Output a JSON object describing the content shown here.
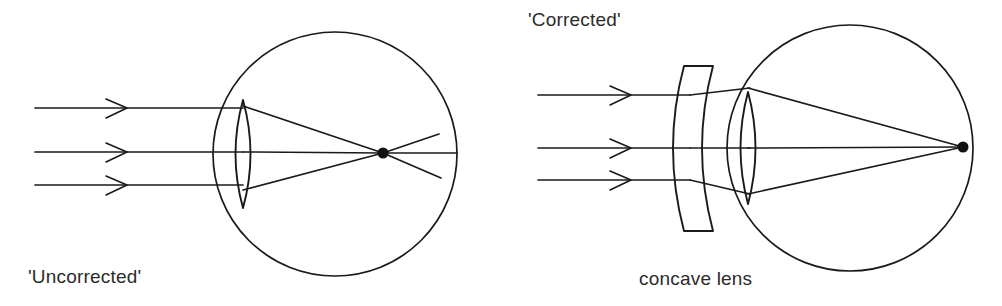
{
  "figure": {
    "title_text": null,
    "background_color": "#ffffff",
    "ink_color": "#1a1a1a",
    "text_color": "#2b2b2b",
    "width": 1002,
    "height": 306
  },
  "panels": [
    {
      "id": "uncorrected",
      "label": "'Uncorrected'",
      "label_position": {
        "x": 28,
        "y": 283
      },
      "eyeball": {
        "cx": 335,
        "cy": 154,
        "r": 122
      },
      "crystalline_lens": {
        "cx": 243,
        "cy": 154,
        "half_height": 54,
        "half_width": 13
      },
      "focal_point": {
        "x": 383,
        "y": 153,
        "r": 5
      },
      "focal_point_note": "focus falls in front of the retina",
      "incoming_rays": [
        {
          "y": 108,
          "x_start": 35,
          "x_end": 243
        },
        {
          "y": 152,
          "x_start": 35,
          "x_end": 243
        },
        {
          "y": 185,
          "x_start": 35,
          "x_end": 243
        }
      ],
      "arrowheads": [
        {
          "x": 124,
          "y": 108
        },
        {
          "x": 124,
          "y": 152
        },
        {
          "x": 124,
          "y": 185
        }
      ],
      "refracted_rays": [
        {
          "x1": 243,
          "y1": 106,
          "x2": 383,
          "y2": 153
        },
        {
          "x1": 243,
          "y1": 152,
          "x2": 383,
          "y2": 153
        },
        {
          "x1": 243,
          "y1": 190,
          "x2": 383,
          "y2": 153
        }
      ],
      "diverging_rays": [
        {
          "x1": 383,
          "y1": 153,
          "x2": 438,
          "y2": 135
        },
        {
          "x1": 383,
          "y1": 153,
          "x2": 457,
          "y2": 153
        },
        {
          "x1": 383,
          "y1": 153,
          "x2": 440,
          "y2": 177
        }
      ]
    },
    {
      "id": "corrected",
      "label": "'Corrected'",
      "label_position": {
        "x": 528,
        "y": 26
      },
      "part_label": "concave lens",
      "part_label_position": {
        "x": 639,
        "y": 285
      },
      "eyeball": {
        "cx": 850,
        "cy": 148,
        "r": 123
      },
      "crystalline_lens": {
        "cx": 748,
        "cy": 148,
        "half_height": 56,
        "half_width": 13
      },
      "concave_lens": {
        "top_y": 66,
        "bottom_y": 231,
        "left_x": 684,
        "right_x": 714,
        "bulge": 22
      },
      "focal_point": {
        "x": 963,
        "y": 147,
        "r": 5
      },
      "focal_point_note": "focus falls on the retina",
      "incoming_rays": [
        {
          "y": 95,
          "x_start": 538,
          "x_end": 690
        },
        {
          "y": 148,
          "x_start": 538,
          "x_end": 690
        },
        {
          "y": 180,
          "x_start": 538,
          "x_end": 690
        }
      ],
      "arrowheads": [
        {
          "x": 628,
          "y": 95
        },
        {
          "x": 628,
          "y": 148
        },
        {
          "x": 628,
          "y": 180
        }
      ],
      "diverged_rays": [
        {
          "x1": 690,
          "y1": 95,
          "x2": 748,
          "y2": 88
        },
        {
          "x1": 690,
          "y1": 148,
          "x2": 748,
          "y2": 148
        },
        {
          "x1": 690,
          "y1": 180,
          "x2": 748,
          "y2": 194
        }
      ],
      "refracted_rays": [
        {
          "x1": 748,
          "y1": 88,
          "x2": 963,
          "y2": 147
        },
        {
          "x1": 748,
          "y1": 148,
          "x2": 963,
          "y2": 147
        },
        {
          "x1": 748,
          "y1": 194,
          "x2": 963,
          "y2": 147
        }
      ]
    }
  ]
}
